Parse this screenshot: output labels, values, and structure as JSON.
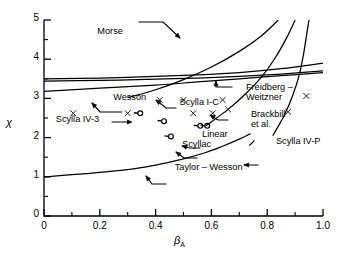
{
  "chart_data": {
    "type": "scatter",
    "title": "",
    "xlabel": "β_A",
    "ylabel": "χ",
    "xlim": [
      0,
      1.0
    ],
    "ylim": [
      0,
      5
    ],
    "grid": false,
    "legend_position": "inline-annotations",
    "xticks": [
      "0",
      "0.2",
      "0.4",
      "0.6",
      "0.8",
      "1.0"
    ],
    "xtick_values": [
      0,
      0.2,
      0.4,
      0.6,
      0.8,
      1.0
    ],
    "xminor_values": [
      0.1,
      0.3,
      0.5,
      0.7,
      0.9
    ],
    "yticks": [
      "0",
      "1",
      "2",
      "3",
      "4",
      "5"
    ],
    "ytick_values": [
      0,
      1,
      2,
      3,
      4,
      5
    ],
    "yminor_values": [
      0.5,
      1.5,
      2.5,
      3.5,
      4.5
    ],
    "curves": [
      {
        "name": "Morse",
        "points": [
          [
            0.3,
            3.02
          ],
          [
            0.4,
            3.22
          ],
          [
            0.5,
            3.48
          ],
          [
            0.6,
            3.8
          ],
          [
            0.7,
            4.2
          ],
          [
            0.78,
            4.6
          ],
          [
            0.84,
            5.0
          ]
        ]
      },
      {
        "name": "steep-right-curve",
        "points": [
          [
            0.58,
            2.3
          ],
          [
            0.66,
            2.72
          ],
          [
            0.72,
            3.1
          ],
          [
            0.78,
            3.55
          ],
          [
            0.83,
            4.05
          ],
          [
            0.87,
            4.55
          ],
          [
            0.9,
            5.0
          ]
        ]
      },
      {
        "name": "far-right-curve",
        "points": [
          [
            0.82,
            2.05
          ],
          [
            0.86,
            2.55
          ],
          [
            0.89,
            3.05
          ],
          [
            0.915,
            3.6
          ],
          [
            0.932,
            4.2
          ],
          [
            0.944,
            4.75
          ],
          [
            0.95,
            5.0
          ]
        ]
      },
      {
        "name": "Wesson",
        "points": [
          [
            0.0,
            3.5
          ],
          [
            0.2,
            3.52
          ],
          [
            0.4,
            3.56
          ],
          [
            0.55,
            3.6
          ],
          [
            0.7,
            3.66
          ],
          [
            0.85,
            3.76
          ],
          [
            1.0,
            3.9
          ]
        ]
      },
      {
        "name": "Freidberg-Weitzner",
        "points": [
          [
            0.0,
            3.44
          ],
          [
            0.2,
            3.46
          ],
          [
            0.4,
            3.49
          ],
          [
            0.55,
            3.52
          ],
          [
            0.7,
            3.56
          ],
          [
            0.85,
            3.62
          ],
          [
            1.0,
            3.7
          ]
        ]
      },
      {
        "name": "lower-theory-curve",
        "points": [
          [
            0.0,
            3.18
          ],
          [
            0.2,
            3.26
          ],
          [
            0.4,
            3.34
          ],
          [
            0.55,
            3.42
          ],
          [
            0.7,
            3.5
          ],
          [
            0.85,
            3.58
          ],
          [
            1.0,
            3.66
          ]
        ]
      },
      {
        "name": "Taylor-Wesson",
        "points": [
          [
            0.0,
            1.0
          ],
          [
            0.15,
            1.08
          ],
          [
            0.3,
            1.18
          ],
          [
            0.4,
            1.3
          ],
          [
            0.5,
            1.46
          ],
          [
            0.58,
            1.62
          ],
          [
            0.64,
            1.78
          ],
          [
            0.7,
            1.96
          ],
          [
            0.74,
            2.1
          ]
        ]
      }
    ],
    "scatter_points": [
      {
        "x": 0.105,
        "y": 2.62,
        "marker": "x"
      },
      {
        "x": 0.3,
        "y": 2.62,
        "marker": "x"
      },
      {
        "x": 0.415,
        "y": 2.96,
        "marker": "x"
      },
      {
        "x": 0.5,
        "y": 2.96,
        "marker": "x"
      },
      {
        "x": 0.535,
        "y": 2.62,
        "marker": "x"
      },
      {
        "x": 0.605,
        "y": 2.62,
        "marker": "x"
      },
      {
        "x": 0.64,
        "y": 2.96,
        "marker": "x"
      },
      {
        "x": 0.66,
        "y": 2.72,
        "marker": "x"
      },
      {
        "x": 0.875,
        "y": 2.66,
        "marker": "x"
      },
      {
        "x": 0.94,
        "y": 3.06,
        "marker": "x"
      }
    ],
    "experiment_points": [
      {
        "label": "Scylla I-C",
        "x": 0.345,
        "y": 2.62,
        "marker": "circle-tail"
      },
      {
        "label": "Scylla IV-3",
        "x": 0.43,
        "y": 2.42,
        "marker": "circle-tail"
      },
      {
        "label": "Brackbill et al.",
        "x": 0.585,
        "y": 2.3,
        "marker": "circle-tail"
      },
      {
        "label": "Linear",
        "x": 0.56,
        "y": 2.3,
        "marker": "circle-tail"
      },
      {
        "label": "Scyllac",
        "x": 0.455,
        "y": 2.03,
        "marker": "circle-tail"
      },
      {
        "label": "Scylla IV-P",
        "x": 0.745,
        "y": 1.86,
        "marker": "tick"
      }
    ],
    "annotations": [
      {
        "name": "morse-label",
        "text": "Morse",
        "x": 0.27,
        "y": 4.68,
        "pointer": true
      },
      {
        "name": "wesson-label",
        "text": "Wesson",
        "x": 0.255,
        "y": 2.99,
        "pointer": true
      },
      {
        "name": "freidberg-weitzner-label",
        "text": "Freidberg –\nWeitzner",
        "x": 0.695,
        "y": 3.24,
        "pointer": true
      },
      {
        "name": "scylla-ic-label",
        "text": "Scylla I-C",
        "x": 0.5,
        "y": 2.85,
        "pointer": true
      },
      {
        "name": "brackbill-label",
        "text": "Brackbill\net al.",
        "x": 0.72,
        "y": 2.55,
        "pointer": true
      },
      {
        "name": "scylla-iv3-label",
        "text": "Scylla IV-3",
        "x": 0.25,
        "y": 2.42,
        "pointer": true
      },
      {
        "name": "linear-label",
        "text": "Linear",
        "x": 0.545,
        "y": 2.03,
        "pointer": true
      },
      {
        "name": "scyllac-label",
        "text": "Scyllac",
        "x": 0.495,
        "y": 1.78,
        "pointer": true
      },
      {
        "name": "scylla-ivp-label",
        "text": "Scylla IV-P",
        "x": 0.81,
        "y": 1.86,
        "pointer": true
      },
      {
        "name": "taylor-wesson-label",
        "text": "Taylor – Wesson",
        "x": 0.44,
        "y": 1.2,
        "pointer": true
      }
    ]
  },
  "axes": {
    "x_label_main": "β",
    "x_label_sub": "A",
    "y_label": "χ"
  },
  "colors": {
    "line": "#000000",
    "background": "#ffffff",
    "marker": "#1a1a1a"
  }
}
